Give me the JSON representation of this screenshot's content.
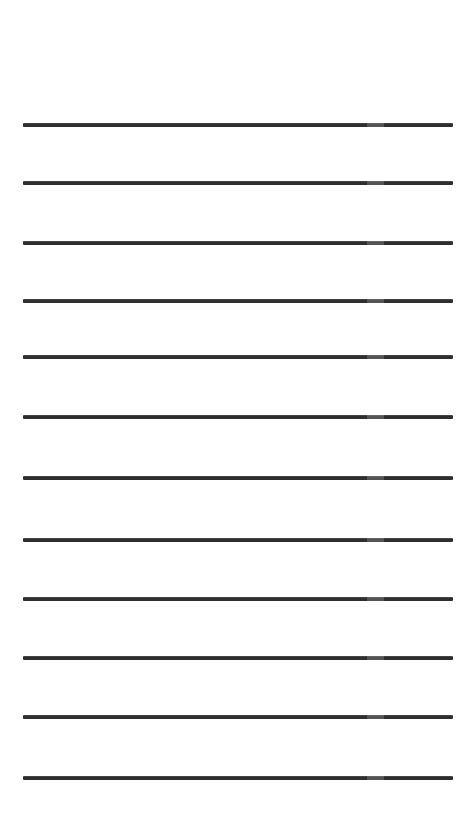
{
  "document": {
    "kind": "lined-writing-paper",
    "title": "Blank Lined Paper",
    "background_color": "#ffffff",
    "page_width": 475,
    "page_height": 824,
    "orientation": "portrait",
    "text_content": "",
    "visible_text": []
  },
  "rules": {
    "count": 12,
    "color": "#2e2e2e",
    "thickness": 4,
    "left_x": 23,
    "right_x": 453,
    "line_length": 430,
    "spacing": 59.4,
    "first_line_y": 125,
    "last_line_y": 778,
    "top_margin": 125,
    "bottom_margin": 46,
    "left_margin": 23,
    "right_margin": 22,
    "lines": [
      {
        "index": 1,
        "y": 125,
        "x1": 23,
        "x2": 453
      },
      {
        "index": 2,
        "y": 183,
        "x1": 23,
        "x2": 453
      },
      {
        "index": 3,
        "y": 243,
        "x1": 23,
        "x2": 453
      },
      {
        "index": 4,
        "y": 301,
        "x1": 23,
        "x2": 453
      },
      {
        "index": 5,
        "y": 357,
        "x1": 23,
        "x2": 453
      },
      {
        "index": 6,
        "y": 417,
        "x1": 23,
        "x2": 453
      },
      {
        "index": 7,
        "y": 478,
        "x1": 23,
        "x2": 453
      },
      {
        "index": 8,
        "y": 540,
        "x1": 23,
        "x2": 453
      },
      {
        "index": 9,
        "y": 599,
        "x1": 23,
        "x2": 453
      },
      {
        "index": 10,
        "y": 658,
        "x1": 23,
        "x2": 453
      },
      {
        "index": 11,
        "y": 717,
        "x1": 23,
        "x2": 453
      },
      {
        "index": 12,
        "y": 778,
        "x1": 23,
        "x2": 453
      }
    ]
  }
}
